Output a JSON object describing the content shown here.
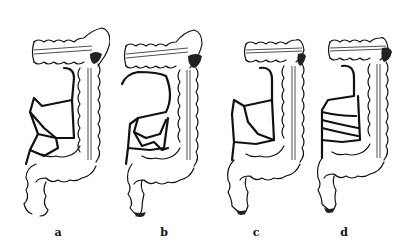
{
  "figure": {
    "panels": [
      {
        "id": "a",
        "label": "a"
      },
      {
        "id": "b",
        "label": "b"
      },
      {
        "id": "c",
        "label": "c"
      },
      {
        "id": "d",
        "label": "d"
      }
    ]
  },
  "colors": {
    "background": "#ffffff",
    "ink": "#111111"
  }
}
